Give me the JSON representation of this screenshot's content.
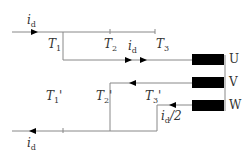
{
  "diagram": {
    "labels": {
      "id_in": {
        "main": "i",
        "sub": "d"
      },
      "id_out": {
        "main": "i",
        "sub": "d"
      },
      "id_mid": {
        "main": "i",
        "sub": "d"
      },
      "id_half": {
        "main": "i",
        "sub": "d",
        "suffix": "/2"
      },
      "T1": {
        "main": "T",
        "sub": "1"
      },
      "T2": {
        "main": "T",
        "sub": "2"
      },
      "T3": {
        "main": "T",
        "sub": "3"
      },
      "T1p": {
        "main": "T",
        "sub": "1",
        "prime": "'"
      },
      "T2p": {
        "main": "T",
        "sub": "2",
        "prime": "'"
      },
      "T3p": {
        "main": "T",
        "sub": "3",
        "prime": "'"
      }
    },
    "phases": [
      "U",
      "V",
      "W"
    ],
    "colors": {
      "line": "#888888",
      "block": "#000000",
      "text": "#333333"
    }
  }
}
